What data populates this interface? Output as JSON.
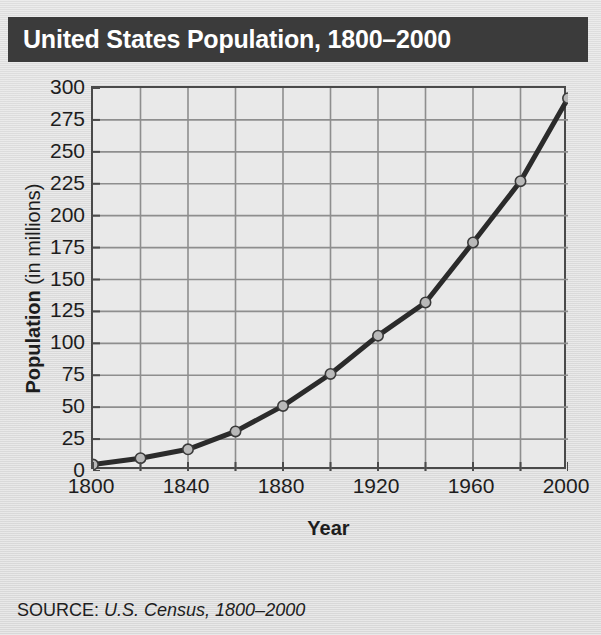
{
  "title": "United States Population, 1800–2000",
  "source": {
    "label": "SOURCE:",
    "value": "U.S. Census, 1800–2000"
  },
  "axis_titles": {
    "y_bold": "Population",
    "y_regular": "(in millions)",
    "x": "Year"
  },
  "colors": {
    "title_band": "#3b3b3b",
    "title_text": "#ffffff",
    "page_background": "#dcdcdc",
    "plot_background": "#e9e9e9",
    "gridline": "#8e8e8e",
    "frame": "#4a4a4a",
    "series_line": "#2b2b2b",
    "marker_fill": "#b9b9b9",
    "marker_stroke": "#3a3a3a",
    "text": "#1d1d1d"
  },
  "chart_data": {
    "type": "line",
    "title": "United States Population, 1800–2000",
    "xlabel": "Year",
    "ylabel": "Population (in millions)",
    "xlim": [
      1800,
      2000
    ],
    "ylim": [
      0,
      300
    ],
    "ytick_step": 25,
    "xtick_step": 20,
    "xtick_label_step": 40,
    "grid": true,
    "legend": false,
    "yticks": [
      300,
      275,
      250,
      225,
      200,
      175,
      150,
      125,
      100,
      75,
      50,
      25,
      0
    ],
    "xticks": [
      1800,
      1820,
      1840,
      1860,
      1880,
      1900,
      1920,
      1940,
      1960,
      1980,
      2000
    ],
    "xtick_labels": [
      "1800",
      "1840",
      "1880",
      "1920",
      "1960",
      "2000"
    ],
    "xtick_labels_values": [
      1800,
      1840,
      1880,
      1920,
      1960,
      2000
    ],
    "x": [
      1800,
      1820,
      1840,
      1860,
      1880,
      1900,
      1920,
      1940,
      1960,
      1980,
      2000
    ],
    "values": [
      5,
      10,
      17,
      31,
      51,
      76,
      106,
      132,
      179,
      227,
      292
    ],
    "series": [
      {
        "name": "United States Population",
        "x": [
          1800,
          1820,
          1840,
          1860,
          1880,
          1900,
          1920,
          1940,
          1960,
          1980,
          2000
        ],
        "values": [
          5,
          10,
          17,
          31,
          51,
          76,
          106,
          132,
          179,
          227,
          292
        ]
      }
    ]
  }
}
